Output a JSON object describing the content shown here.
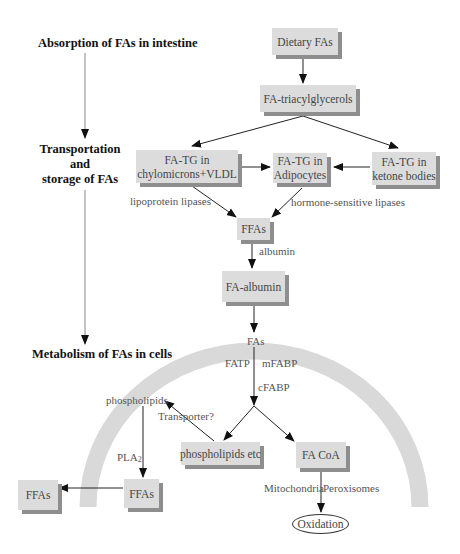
{
  "stages": {
    "absorption": "Absorption of FAs in intestine",
    "transport_line1": "Transportation and",
    "transport_line2": "storage of FAs",
    "metabolism": "Metabolism of FAs in cells"
  },
  "nodes": {
    "dietary_fas": "Dietary FAs",
    "fa_triacylglycerols": "FA-triacylglycerols",
    "chylo_line1": "FA-TG in",
    "chylo_line2": "chylomicrons+VLDL",
    "adipo_line1": "FA-TG in",
    "adipo_line2": "Adipocytes",
    "ketone_line1": "FA-TG in",
    "ketone_line2": "ketone bodies",
    "ffas_plasma": "FFAs",
    "fa_albumin": "FA-albumin",
    "phospholipids_etc": "phospholipids etc",
    "fa_coa": "FA CoA",
    "ffas_inner": "FFAs",
    "ffas_outer": "FFAs",
    "oxidation": "Oxidation"
  },
  "labels": {
    "lipoprotein_lipases": "lipoprotein lipases",
    "hormone_sensitive_lipases": "hormone-sensitive lipases",
    "albumin": "albumin",
    "fas": "FAs",
    "fatp": "FATP",
    "mfabp": "mFABP",
    "cfabp": "cFABP",
    "phospholipids": "phospholipids",
    "transporter": "Transporter?",
    "pla": "PLA",
    "pla_sub": "2",
    "mitochondria": "Mitochondria",
    "peroxisomes": "Peroxisomes"
  },
  "colors": {
    "box_fill": "#dcdcdc",
    "box_shadow": "#8e8e8e",
    "membrane": "#d9d9d9",
    "arrow": "#222222",
    "stage_line": "#888888"
  }
}
